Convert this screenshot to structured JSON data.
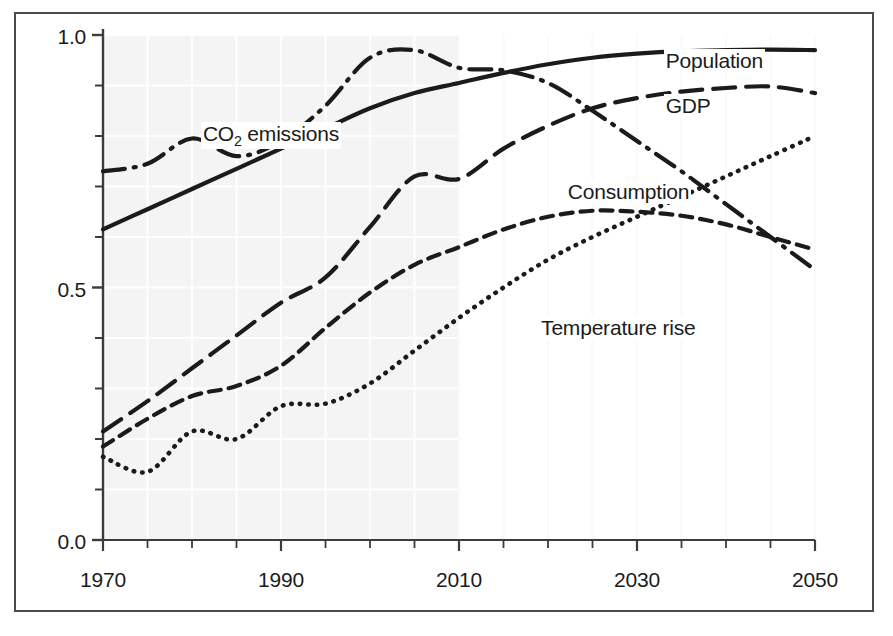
{
  "chart_data": {
    "type": "line",
    "title": "",
    "subtitle": "",
    "xlabel": "",
    "ylabel": "",
    "xlim": [
      1970,
      2050
    ],
    "ylim": [
      0.0,
      1.0
    ],
    "grid": true,
    "legend_position": "inline-labels",
    "x_tick_labels": [
      "1970",
      "1990",
      "2010",
      "2030",
      "2050"
    ],
    "x_tick_values": [
      1970,
      1990,
      2010,
      2030,
      2050
    ],
    "x_minor_tick_values": [
      1975,
      1980,
      1985,
      1995,
      2000,
      2005,
      2015,
      2020,
      2025,
      2035,
      2040,
      2045
    ],
    "y_tick_labels": [
      "0.0",
      "0.5",
      "1.0"
    ],
    "y_tick_values": [
      0.0,
      0.5,
      1.0
    ],
    "y_minor_tick_values": [
      0.1,
      0.2,
      0.3,
      0.4,
      0.6,
      0.7,
      0.8,
      0.9
    ],
    "x": [
      1970,
      1975,
      1980,
      1985,
      1990,
      1995,
      2000,
      2005,
      2010,
      2015,
      2020,
      2025,
      2030,
      2035,
      2040,
      2045,
      2050
    ],
    "series": [
      {
        "name": "Population",
        "label": "Population",
        "line_style": "solid",
        "color": "#1b1b1b",
        "values": [
          0.615,
          0.655,
          0.695,
          0.735,
          0.775,
          0.815,
          0.855,
          0.885,
          0.905,
          0.925,
          0.942,
          0.955,
          0.963,
          0.968,
          0.97,
          0.971,
          0.97
        ],
        "label_x": 2033,
        "label_y": 0.945
      },
      {
        "name": "CO2 emissions",
        "label_html": "CO<sub>2</sub> emissions",
        "label": "CO2 emissions",
        "line_style": "dash-dot",
        "color": "#1b1b1b",
        "values": [
          0.73,
          0.745,
          0.795,
          0.76,
          0.79,
          0.86,
          0.955,
          0.97,
          0.935,
          0.93,
          0.905,
          0.85,
          0.79,
          0.73,
          0.665,
          0.6,
          0.535
        ],
        "label_x": 1981,
        "label_y": 0.8
      },
      {
        "name": "GDP",
        "label": "GDP",
        "line_style": "long-dash",
        "color": "#1b1b1b",
        "values": [
          0.215,
          0.275,
          0.34,
          0.405,
          0.47,
          0.52,
          0.62,
          0.72,
          0.715,
          0.775,
          0.82,
          0.855,
          0.875,
          0.888,
          0.895,
          0.898,
          0.885
        ],
        "label_x": 2033,
        "label_y": 0.855
      },
      {
        "name": "Consumption",
        "label": "Consumption",
        "line_style": "short-dash",
        "color": "#1b1b1b",
        "values": [
          0.185,
          0.24,
          0.285,
          0.305,
          0.345,
          0.42,
          0.49,
          0.545,
          0.58,
          0.615,
          0.64,
          0.652,
          0.65,
          0.642,
          0.625,
          0.6,
          0.575
        ],
        "label_x": 2022,
        "label_y": 0.685
      },
      {
        "name": "Temperature rise",
        "label": "Temperature rise",
        "line_style": "dotted",
        "color": "#1b1b1b",
        "values": [
          0.165,
          0.135,
          0.215,
          0.2,
          0.265,
          0.27,
          0.31,
          0.375,
          0.44,
          0.5,
          0.555,
          0.6,
          0.64,
          0.68,
          0.72,
          0.76,
          0.8
        ],
        "label_x": 2019,
        "label_y": 0.415
      }
    ],
    "shaded_region": {
      "name": "historical-period-shading",
      "from_x": 1970,
      "to_x": 2010,
      "color": "#f4f4f4"
    }
  }
}
